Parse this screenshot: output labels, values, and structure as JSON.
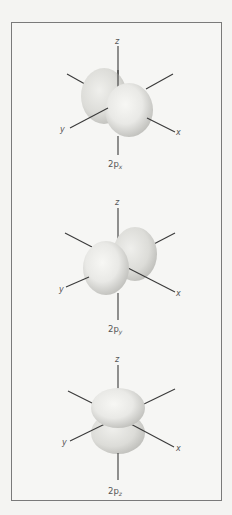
{
  "figure": {
    "orbitals": [
      {
        "id": "2px",
        "caption_main": "2p",
        "caption_sub": "x",
        "axis_labels": {
          "z": "z",
          "y": "y",
          "x": "x"
        },
        "lobe_orientation": "x"
      },
      {
        "id": "2py",
        "caption_main": "2p",
        "caption_sub": "y",
        "axis_labels": {
          "z": "z",
          "y": "y",
          "x": "x"
        },
        "lobe_orientation": "y"
      },
      {
        "id": "2pz",
        "caption_main": "2p",
        "caption_sub": "z",
        "axis_labels": {
          "z": "z",
          "y": "y",
          "x": "x"
        },
        "lobe_orientation": "z"
      }
    ],
    "colors": {
      "lobe_light": "#f3f3f0",
      "lobe_dark": "#c6c6c2",
      "axis": "#3a3a3a",
      "border": "#7a7a7a"
    }
  }
}
